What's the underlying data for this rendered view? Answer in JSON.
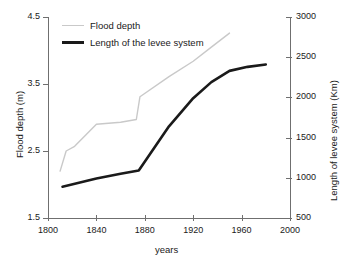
{
  "chart_data": {
    "type": "line",
    "title": "",
    "xlabel": "years",
    "ylabel": "Flood depth (m)",
    "y2label": "Length of levee system (Km)",
    "xlim": [
      1800,
      2000
    ],
    "ylim": [
      1.5,
      4.5
    ],
    "y2lim": [
      500,
      3000
    ],
    "xticks": [
      1800,
      1840,
      1880,
      1920,
      1960,
      2000
    ],
    "yticks": [
      1.5,
      2.5,
      3.5,
      4.5
    ],
    "y2ticks": [
      500,
      1000,
      1500,
      2000,
      2500,
      3000
    ],
    "grid": false,
    "legend_position": "top-left",
    "series": [
      {
        "name": "Flood depth",
        "axis": "left",
        "color": "#c9c9c9",
        "linewidth": 1.4,
        "unit": "m",
        "points": [
          [
            1810,
            2.2
          ],
          [
            1815,
            2.5
          ],
          [
            1822,
            2.57
          ],
          [
            1840,
            2.9
          ],
          [
            1860,
            2.93
          ],
          [
            1873,
            2.97
          ],
          [
            1876,
            3.31
          ],
          [
            1900,
            3.61
          ],
          [
            1920,
            3.84
          ],
          [
            1935,
            4.05
          ],
          [
            1950,
            4.26
          ]
        ]
      },
      {
        "name": "Length of the levee system",
        "axis": "right",
        "color": "#1a1a1a",
        "linewidth": 2.6,
        "unit": "Km",
        "points": [
          [
            1812,
            890
          ],
          [
            1840,
            990
          ],
          [
            1860,
            1050
          ],
          [
            1875,
            1090
          ],
          [
            1900,
            1640
          ],
          [
            1920,
            1990
          ],
          [
            1935,
            2190
          ],
          [
            1950,
            2330
          ],
          [
            1965,
            2380
          ],
          [
            1980,
            2410
          ]
        ]
      }
    ],
    "legend": [
      {
        "label": "Flood depth",
        "color": "#c9c9c9",
        "style": "thin"
      },
      {
        "label": "Length of the levee system",
        "color": "#1a1a1a",
        "style": "thick"
      }
    ]
  },
  "axes": {
    "x_title": "years",
    "y_left_title": "Flood depth (m)",
    "y_right_title": "Length of levee system (Km)",
    "x_tick_labels": [
      "1800",
      "1840",
      "1880",
      "1920",
      "1960",
      "2000"
    ],
    "y_left_tick_labels": [
      "1.5",
      "2.5",
      "3.5",
      "4.5"
    ],
    "y_right_tick_labels": [
      "500",
      "1000",
      "1500",
      "2000",
      "2500",
      "3000"
    ],
    "axis_color": "#6f6f6f"
  }
}
